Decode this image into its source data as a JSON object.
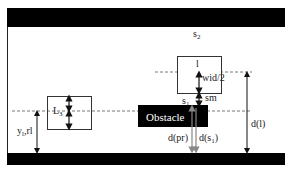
{
  "diagram": {
    "labels": {
      "s2": "s",
      "s2_sub": "2",
      "l_box": "l",
      "wid2": "wid/2",
      "s1": "s",
      "s1_sub": "1",
      "sm": "sm",
      "obstacle": "Obstacle",
      "dpr": "d(pr)",
      "ds1_pre": "d(s",
      "ds1_sub": "1",
      "ds1_post": ")",
      "dl": "d(l)",
      "L3": "L",
      "L3_sub": "3",
      "yrl_pre": "y",
      "yrl_sub": "l",
      "yrl_post": ",rl"
    },
    "colors": {
      "road_edge": "#000000",
      "obstacle_fill": "#000000",
      "arrow_gray": "#888888",
      "arrow_dark": "#111111",
      "dashed": "#555555"
    }
  }
}
